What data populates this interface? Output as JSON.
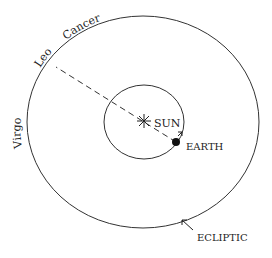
{
  "diagram": {
    "labels": {
      "sun": "SUN",
      "earth": "EARTH",
      "ecliptic": "ECLIPTIC",
      "virgo": "Virgo",
      "leo": "Leo",
      "cancer": "Cancer"
    },
    "colors": {
      "line": "#333333",
      "text": "#222222",
      "background": "#ffffff"
    }
  }
}
